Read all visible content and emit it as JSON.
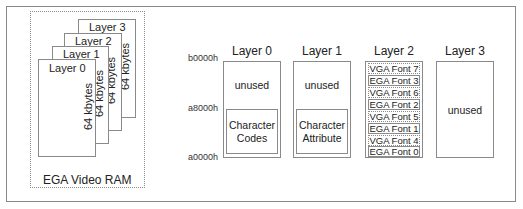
{
  "left_panel": {
    "stack_layers": [
      {
        "title": "Layer 0",
        "size": "64 kbytes"
      },
      {
        "title": "Layer 1",
        "size": "64 kbytes"
      },
      {
        "title": "Layer 2",
        "size": "64 kbytes"
      },
      {
        "title": "Layer 3",
        "size": "64 kbytes"
      }
    ],
    "caption": "EGA Video RAM"
  },
  "addresses": {
    "top": "b0000h",
    "middle": "a8000h",
    "bottom": "a0000h"
  },
  "layers": [
    {
      "title": "Layer 0",
      "upper": "unused",
      "lower_line1": "Character",
      "lower_line2": "Codes"
    },
    {
      "title": "Layer 1",
      "upper": "unused",
      "lower_line1": "Character",
      "lower_line2": "Attribute"
    },
    {
      "title": "Layer 2",
      "fonts": [
        "VGA Font 7",
        "EGA Font 3",
        "VGA Font 6",
        "EGA Font 2",
        "VGA Font 5",
        "EGA Font 1",
        "VGA Font 4",
        "EGA Font 0"
      ]
    },
    {
      "title": "Layer 3",
      "content": "unused"
    }
  ],
  "colors": {
    "border": "#8a8a8a",
    "text": "#222222",
    "background": "#ffffff"
  }
}
